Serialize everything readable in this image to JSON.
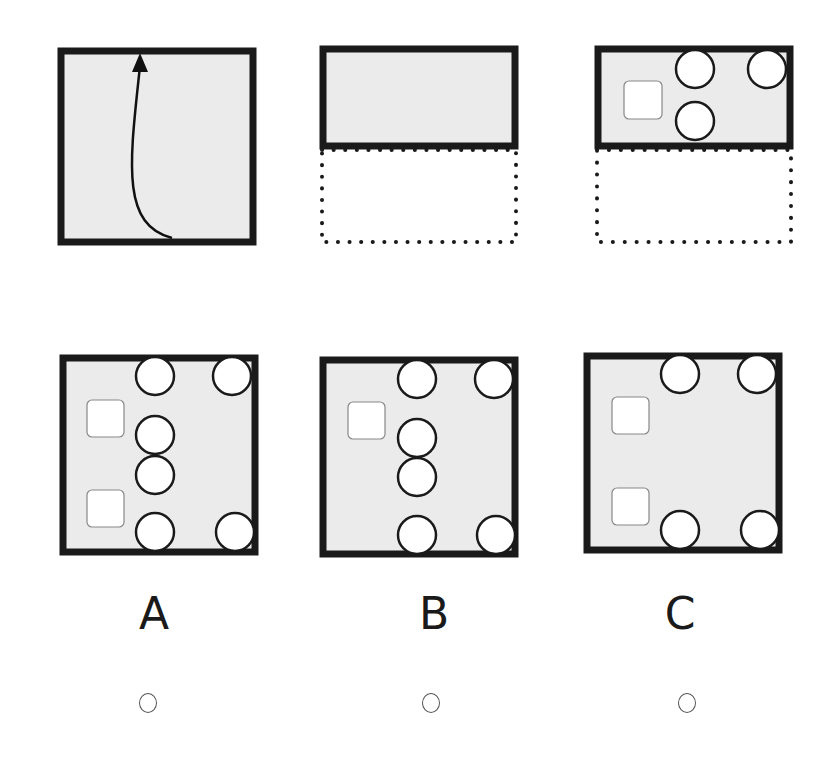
{
  "puzzle": {
    "type": "paper-folding",
    "step_1": {
      "description": "square sheet with upward fold arrow",
      "icon": "fold-arrow-icon"
    },
    "step_2": {
      "description": "sheet folded in half upward; dotted outline shows original lower half"
    },
    "step_3": {
      "description": "folded sheet with punched holes",
      "holes": {
        "circles": 3,
        "squares": 1
      }
    }
  },
  "options": [
    {
      "label": "A",
      "circles": 6,
      "squares": 2,
      "selected": false
    },
    {
      "label": "B",
      "circles": 6,
      "squares": 1,
      "selected": false
    },
    {
      "label": "C",
      "circles": 4,
      "squares": 2,
      "selected": false
    }
  ],
  "colors": {
    "paper": "#ebebeb",
    "border": "#1a1a1a",
    "hole": "#ffffff",
    "square_border": "#888888"
  }
}
